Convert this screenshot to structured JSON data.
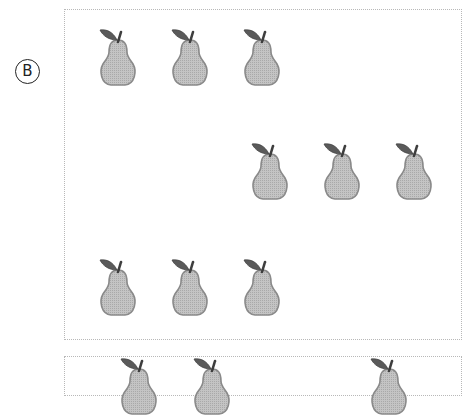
{
  "option": {
    "label": "B"
  },
  "pear_groups": [
    {
      "count": 3,
      "positions": [
        [
          94,
          26
        ],
        [
          166,
          26
        ],
        [
          238,
          26
        ]
      ]
    },
    {
      "count": 3,
      "positions": [
        [
          246,
          140
        ],
        [
          318,
          140
        ],
        [
          390,
          140
        ]
      ]
    },
    {
      "count": 3,
      "positions": [
        [
          94,
          256
        ],
        [
          166,
          256
        ],
        [
          238,
          256
        ]
      ]
    }
  ],
  "next_box_partial_pears": [
    [
      115,
      355
    ],
    [
      188,
      355
    ],
    [
      365,
      355
    ]
  ],
  "colors": {
    "pear_body": "#bdbdbd",
    "pear_outline": "#8a8a8a",
    "leaf": "#5a5a5a",
    "box_border": "#b8b8b8"
  }
}
